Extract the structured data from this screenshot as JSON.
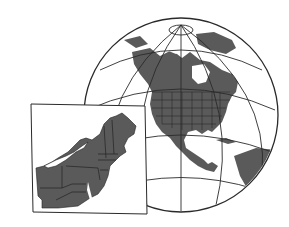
{
  "illustration": {
    "subject": "Globe showing North America with inset map of northeastern United States",
    "colors": {
      "background": "#ffffff",
      "land": "#5a5a5a",
      "ocean": "#ffffff",
      "lines": "#2a2a2a",
      "water_features": "#ffffff"
    }
  }
}
